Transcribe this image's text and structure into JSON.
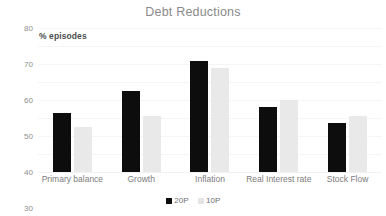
{
  "chart_data": {
    "type": "bar",
    "title": "Debt Reductions",
    "xlabel": "",
    "ylabel": "% episodes",
    "ylim": [
      0,
      80
    ],
    "yticks": [
      80,
      70,
      60,
      50,
      40,
      30,
      20,
      10,
      0
    ],
    "grid": true,
    "legend_position": "bottom",
    "categories": [
      "Primary balance",
      "Growth",
      "Inflation",
      "Real Interest rate",
      "Stock Flow"
    ],
    "series": [
      {
        "name": "20P",
        "color": "#0d0d0d",
        "values": [
          33,
          45,
          61.5,
          36,
          27
        ]
      },
      {
        "name": "10P",
        "color": "#e9e9e9",
        "values": [
          25,
          31,
          58,
          40,
          31
        ]
      }
    ]
  },
  "axis_caption": "% episodes",
  "legend": [
    {
      "label": "20P"
    },
    {
      "label": "10P"
    }
  ]
}
